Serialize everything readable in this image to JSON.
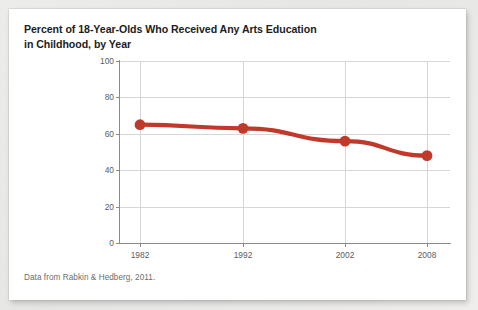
{
  "card": {
    "background": "#ffffff",
    "page_background": "#e9e9e7"
  },
  "title": {
    "line1": "Percent of 18-Year-Olds Who Received Any Arts Education",
    "line2": "in Childhood, by Year"
  },
  "footnote": {
    "text": "Data from Rabkin & Hedberg, 2011."
  },
  "chart_data": {
    "type": "line",
    "title": "Percent of 18-Year-Olds Who Received Any Arts Education in Childhood, by Year",
    "subtitle": "",
    "xlabel": "",
    "ylabel": "",
    "categories": [
      "1982",
      "1992",
      "2002",
      "2008"
    ],
    "x": [
      1982,
      1992,
      2002,
      2008
    ],
    "values": [
      65,
      63,
      56,
      48
    ],
    "series": [
      {
        "name": "Percent receiving any arts education",
        "values": [
          65,
          63,
          56,
          48
        ],
        "color": "#c0392b"
      }
    ],
    "ylim": [
      0,
      100
    ],
    "yticks": [
      0,
      20,
      40,
      60,
      80,
      100
    ],
    "ytick_labels": [
      "0",
      "20",
      "40",
      "60",
      "80",
      "100"
    ],
    "xtick_labels": [
      "1982",
      "1992",
      "2002",
      "2008"
    ],
    "grid": true,
    "grid_axis": "both",
    "legend": false,
    "legend_position": "none",
    "marker": "circle",
    "line_color": "#c0392b",
    "marker_color": "#c0392b",
    "grid_color": "#d6d6d6",
    "axis_color": "#8a8a8a",
    "annotations": []
  }
}
